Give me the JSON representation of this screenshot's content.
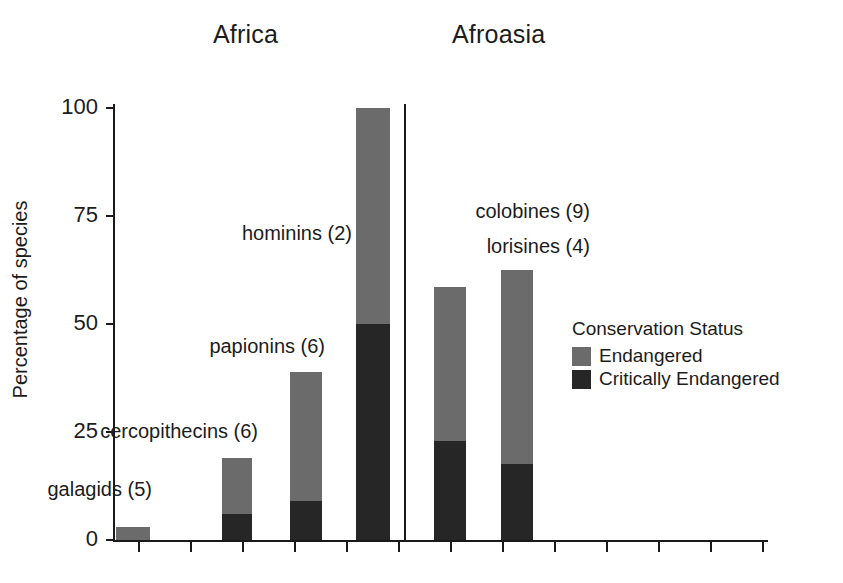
{
  "chart_data": {
    "type": "bar",
    "subtype": "stacked-bar",
    "title": "",
    "xlabel": "",
    "ylabel": "Percentage of species",
    "ylim": [
      0,
      100
    ],
    "yticks": [
      0,
      25,
      50,
      75,
      100
    ],
    "ytick_labels": [
      "0",
      "25",
      "50",
      "75",
      "100"
    ],
    "grid": false,
    "legend_position": "right",
    "legend_title": "Conservation Status",
    "groups": [
      "Africa",
      "Afroasia"
    ],
    "categories": [
      "galagids (5)",
      "cercopithecins (6)",
      "papionins (6)",
      "hominins (2)",
      "colobines (9)",
      "lorisines (4)"
    ],
    "series": [
      {
        "name": "Endangered",
        "color": "#6b6b6b",
        "values": [
          3,
          13,
          30,
          50,
          35.5,
          45
        ]
      },
      {
        "name": "Critically Endangered",
        "color": "#262626",
        "values": [
          0,
          6,
          9,
          50,
          23,
          17.5
        ]
      }
    ],
    "totals": [
      3,
      19,
      39,
      100,
      58.5,
      62.5
    ],
    "bars": [
      {
        "id": "galagids",
        "label": "galagids (5)",
        "group": "Africa",
        "n": 5,
        "endangered": 3,
        "critically_endangered": 0,
        "total": 3
      },
      {
        "id": "cercopithecins",
        "label": "cercopithecins (6)",
        "group": "Africa",
        "n": 6,
        "endangered": 13,
        "critically_endangered": 6,
        "total": 19
      },
      {
        "id": "papionins",
        "label": "papionins (6)",
        "group": "Africa",
        "n": 6,
        "endangered": 30,
        "critically_endangered": 9,
        "total": 39
      },
      {
        "id": "hominins",
        "label": "hominins (2)",
        "group": "Africa",
        "n": 2,
        "endangered": 50,
        "critically_endangered": 50,
        "total": 100
      },
      {
        "id": "colobines",
        "label": "colobines (9)",
        "group": "Afroasia",
        "n": 9,
        "endangered": 35.5,
        "critically_endangered": 23,
        "total": 58.5
      },
      {
        "id": "lorisines",
        "label": "lorisines (4)",
        "group": "Afroasia",
        "n": 4,
        "endangered": 45,
        "critically_endangered": 17.5,
        "total": 62.5
      }
    ]
  },
  "axes": {
    "y_title": "Percentage of species",
    "y_ticks": [
      {
        "value": 100,
        "label": "100"
      },
      {
        "value": 75,
        "label": "75"
      },
      {
        "value": 50,
        "label": "50"
      },
      {
        "value": 25,
        "label": "25"
      },
      {
        "value": 0,
        "label": "0"
      }
    ],
    "x_minor_tick_count": 13
  },
  "groups": {
    "africa": {
      "label": "Africa"
    },
    "afroasia": {
      "label": "Afroasia"
    }
  },
  "annotations": [
    {
      "id": "galagids",
      "text": "galagids (5)"
    },
    {
      "id": "cercopithecins",
      "text": "cercopithecins (6)"
    },
    {
      "id": "papionins",
      "text": "papionins (6)"
    },
    {
      "id": "hominins",
      "text": "hominins (2)"
    },
    {
      "id": "colobines",
      "text": "colobines (9)"
    },
    {
      "id": "lorisines",
      "text": "lorisines (4)"
    }
  ],
  "legend": {
    "title": "Conservation Status",
    "items": [
      {
        "label": "Endangered",
        "color": "#6b6b6b"
      },
      {
        "label": "Critically Endangered",
        "color": "#262626"
      }
    ]
  },
  "colors": {
    "endangered": "#6b6b6b",
    "critically_endangered": "#262626",
    "axis": "#1a1a1a",
    "text": "#1c1c1c",
    "background": "#ffffff"
  }
}
